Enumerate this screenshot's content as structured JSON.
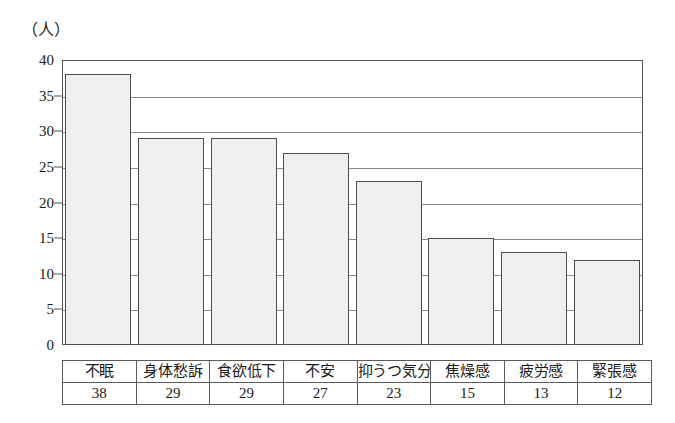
{
  "axis": {
    "unit_label": "（人）",
    "ticks": [
      40,
      35,
      30,
      25,
      20,
      15,
      10,
      5,
      0
    ]
  },
  "colors": {
    "bar_fill": "#efefef",
    "bar_border": "#4d4d4d",
    "frame": "#555555",
    "gridline": "#8a8a8a",
    "text": "#1a1a1a"
  },
  "chart_data": {
    "type": "bar",
    "title": "",
    "xlabel": "",
    "ylabel": "（人）",
    "ylim": [
      0,
      40
    ],
    "ytick_step": 5,
    "grid": true,
    "legend": "none",
    "categories": [
      "不眠",
      "身体愁訴",
      "食欲低下",
      "不安",
      "抑うつ気分",
      "焦燥感",
      "疲労感",
      "緊張感"
    ],
    "values": [
      38,
      29,
      29,
      27,
      23,
      15,
      13,
      12
    ],
    "table": {
      "label_row": [
        "不眠",
        "身体愁訴",
        "食欲低下",
        "不安",
        "抑うつ気分",
        "焦燥感",
        "疲労感",
        "緊張感"
      ],
      "value_row": [
        "38",
        "29",
        "29",
        "27",
        "23",
        "15",
        "13",
        "12"
      ]
    }
  }
}
